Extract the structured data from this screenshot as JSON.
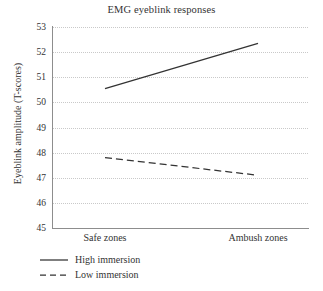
{
  "chart_data": {
    "type": "line",
    "title": "EMG eyeblink responses",
    "xlabel": "",
    "ylabel": "Eyeblink amplitude (T-scores)",
    "categories": [
      "Safe zones",
      "Ambush zones"
    ],
    "yticks": [
      53,
      52,
      51,
      50,
      49,
      48,
      47,
      46,
      45
    ],
    "ylim": [
      45,
      53
    ],
    "grid": "horizontal-dotted",
    "legend_position": "below-left",
    "series": [
      {
        "name": "High immersion",
        "style": "solid",
        "color": "#333333",
        "values": [
          50.55,
          52.35
        ]
      },
      {
        "name": "Low immersion",
        "style": "dashed",
        "color": "#333333",
        "values": [
          47.8,
          47.1
        ]
      }
    ]
  },
  "colors": {
    "axis": "#8d8d8d",
    "grid": "#c9c9c9",
    "text": "#333333",
    "line": "#333333",
    "background": "#ffffff"
  }
}
